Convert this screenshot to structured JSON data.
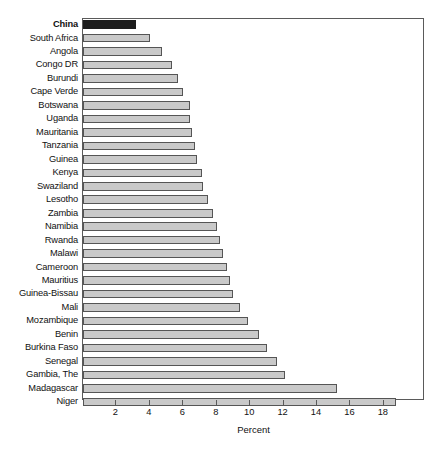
{
  "chart_data": {
    "type": "bar",
    "orientation": "horizontal",
    "title": "",
    "xlabel": "Percent",
    "ylabel": "",
    "xlim": [
      0,
      20.4
    ],
    "grid": false,
    "legend": null,
    "highlight_category": "China",
    "colors": {
      "bar_fill": "#c9c9c9",
      "bar_border": "#555555",
      "highlight_fill": "#1c1c1c",
      "frame": "#5a5a5a",
      "text": "#111111",
      "background": "#ffffff"
    },
    "xticks": [
      2,
      4,
      6,
      8,
      10,
      12,
      14,
      16,
      18
    ],
    "xtick_labels": [
      "2",
      "4",
      "6",
      "8",
      "10",
      "12",
      "14",
      "16",
      "18"
    ],
    "categories": [
      "China",
      "South Africa",
      "Angola",
      "Congo DR",
      "Burundi",
      "Cape Verde",
      "Botswana",
      "Uganda",
      "Mauritania",
      "Tanzania",
      "Guinea",
      "Kenya",
      "Swaziland",
      "Lesotho",
      "Zambia",
      "Namibia",
      "Rwanda",
      "Malawi",
      "Cameroon",
      "Mauritius",
      "Guinea-Bissau",
      "Mali",
      "Mozambique",
      "Benin",
      "Burkina Faso",
      "Senegal",
      "Gambia, The",
      "Madagascar",
      "Niger"
    ],
    "values": [
      3.2,
      4.0,
      4.7,
      5.3,
      5.7,
      6.0,
      6.4,
      6.4,
      6.5,
      6.7,
      6.8,
      7.1,
      7.2,
      7.5,
      7.8,
      8.0,
      8.2,
      8.4,
      8.6,
      8.8,
      9.0,
      9.4,
      9.9,
      10.5,
      11.0,
      11.6,
      12.1,
      15.2,
      18.7
    ]
  }
}
